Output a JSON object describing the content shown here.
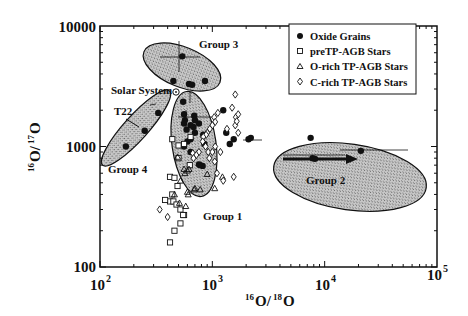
{
  "chart_data": {
    "type": "scatter",
    "title": "",
    "xlabel": "16O/18O",
    "ylabel": "16O/17O",
    "xscale": "log",
    "yscale": "log",
    "xlim": [
      100,
      100000
    ],
    "ylim": [
      100,
      10000
    ],
    "x_tick_labels": [
      "10^2",
      "10^3",
      "10^4",
      "10^5"
    ],
    "y_tick_labels": [
      "100",
      "1000",
      "10000"
    ],
    "grid": false,
    "legend_position": "upper right",
    "legend": [
      "Oxide Grains",
      "preTP-AGB Stars",
      "O-rich TP-AGB Stars",
      "C-rich TP-AGB Stars"
    ],
    "annotations": [
      "Group 1",
      "Group 2",
      "Group 3",
      "Group 4",
      "Solar System",
      "T22"
    ],
    "solar_system": {
      "x": 499,
      "y": 2620
    },
    "groups": [
      {
        "name": "Group 1",
        "center": [
          700,
          1100
        ],
        "shape": "ellipse"
      },
      {
        "name": "Group 2",
        "center": [
          12000,
          850
        ],
        "shape": "ellipse"
      },
      {
        "name": "Group 3",
        "center": [
          700,
          4500
        ],
        "shape": "ellipse"
      },
      {
        "name": "Group 4",
        "center": [
          260,
          1500
        ],
        "shape": "ellipse"
      }
    ],
    "series": [
      {
        "name": "Oxide Grains",
        "marker": "filled-circle",
        "points": [
          [
            540,
            5600
          ],
          [
            450,
            3500
          ],
          [
            620,
            3300
          ],
          [
            660,
            3250
          ],
          [
            860,
            3500
          ],
          [
            550,
            2350
          ],
          [
            330,
            1900
          ],
          [
            250,
            1350
          ],
          [
            170,
            1000
          ],
          [
            560,
            1850
          ],
          [
            570,
            1650
          ],
          [
            700,
            1650
          ],
          [
            680,
            1450
          ],
          [
            640,
            1500
          ],
          [
            590,
            1380
          ],
          [
            700,
            1300
          ],
          [
            830,
            1250
          ],
          [
            600,
            1100
          ],
          [
            560,
            1000
          ],
          [
            850,
            1050
          ],
          [
            640,
            1150
          ],
          [
            760,
            1550
          ],
          [
            690,
            1800
          ],
          [
            560,
            1550
          ],
          [
            640,
            900
          ],
          [
            780,
            700
          ],
          [
            820,
            690
          ],
          [
            760,
            710
          ],
          [
            1250,
            2000
          ],
          [
            1550,
            1150
          ],
          [
            1330,
            1300
          ],
          [
            2100,
            1150
          ],
          [
            2200,
            1180
          ],
          [
            1430,
            1050
          ],
          [
            7500,
            1180
          ],
          [
            7800,
            800
          ],
          [
            8200,
            790
          ],
          [
            21000,
            920
          ]
        ]
      },
      {
        "name": "preTP-AGB Stars",
        "marker": "open-square",
        "points": [
          [
            440,
            1150
          ],
          [
            500,
            1020
          ],
          [
            560,
            1050
          ],
          [
            640,
            1200
          ],
          [
            420,
            560
          ],
          [
            460,
            550
          ],
          [
            490,
            470
          ],
          [
            440,
            400
          ],
          [
            420,
            350
          ],
          [
            450,
            350
          ],
          [
            480,
            330
          ],
          [
            380,
            360
          ],
          [
            520,
            300
          ],
          [
            520,
            230
          ],
          [
            460,
            200
          ],
          [
            560,
            270
          ],
          [
            420,
            160
          ],
          [
            550,
            270
          ],
          [
            630,
            700
          ],
          [
            500,
            800
          ]
        ]
      },
      {
        "name": "O-rich TP-AGB Stars",
        "marker": "open-triangle",
        "points": [
          [
            490,
            820
          ],
          [
            560,
            650
          ],
          [
            570,
            600
          ],
          [
            600,
            630
          ],
          [
            620,
            650
          ],
          [
            520,
            520
          ],
          [
            600,
            420
          ],
          [
            610,
            400
          ],
          [
            690,
            440
          ],
          [
            780,
            440
          ],
          [
            460,
            400
          ],
          [
            700,
            450
          ],
          [
            900,
            590
          ],
          [
            1230,
            560
          ],
          [
            510,
            340
          ],
          [
            1050,
            450
          ],
          [
            580,
            320
          ]
        ]
      },
      {
        "name": "C-rich TP-AGB Stars",
        "marker": "open-diamond",
        "points": [
          [
            1600,
            2700
          ],
          [
            1120,
            1900
          ],
          [
            1040,
            1750
          ],
          [
            1620,
            1750
          ],
          [
            1700,
            1850
          ],
          [
            1060,
            1600
          ],
          [
            1000,
            1500
          ],
          [
            950,
            1400
          ],
          [
            900,
            1300
          ],
          [
            880,
            1250
          ],
          [
            830,
            1200
          ],
          [
            820,
            1100
          ],
          [
            870,
            1000
          ],
          [
            920,
            900
          ],
          [
            1060,
            1000
          ],
          [
            940,
            800
          ],
          [
            760,
            900
          ],
          [
            670,
            880
          ],
          [
            720,
            850
          ],
          [
            680,
            800
          ],
          [
            1000,
            900
          ],
          [
            1050,
            750
          ],
          [
            1180,
            900
          ],
          [
            1600,
            1500
          ],
          [
            1700,
            1300
          ],
          [
            1100,
            600
          ],
          [
            1250,
            520
          ],
          [
            1550,
            560
          ],
          [
            1350,
            1400
          ],
          [
            340,
            300
          ],
          [
            400,
            260
          ],
          [
            1500,
            2100
          ],
          [
            1650,
            1620
          ]
        ]
      }
    ]
  },
  "legend": {
    "items": [
      {
        "label": "Oxide Grains",
        "marker": "filled-circle"
      },
      {
        "label": "preTP-AGB Stars",
        "marker": "open-square"
      },
      {
        "label": "O-rich TP-AGB Stars",
        "marker": "open-triangle"
      },
      {
        "label": "C-rich TP-AGB Stars",
        "marker": "open-diamond"
      }
    ]
  },
  "axes": {
    "x_title_main": "O/",
    "x_title_sup1": "16",
    "x_title_sup2": "18",
    "x_title_end": "O",
    "y_title_sup1": "16",
    "y_title_mid": "O/",
    "y_title_sup2": "17",
    "y_title_end": "O",
    "x_ticks": [
      {
        "base": "10",
        "exp": "2"
      },
      {
        "base": "10",
        "exp": "3"
      },
      {
        "base": "10",
        "exp": "4"
      },
      {
        "base": "10",
        "exp": "5"
      }
    ],
    "y_ticks": [
      "100",
      "1000",
      "10000"
    ]
  },
  "annotations": {
    "group1": "Group 1",
    "group2": "Group 2",
    "group3": "Group 3",
    "group4": "Group 4",
    "solar_system": "Solar System",
    "t22": "T22"
  },
  "colors": {
    "ellipse_fill": "#b8b8b8",
    "ink": "#111111",
    "background": "#ffffff"
  }
}
